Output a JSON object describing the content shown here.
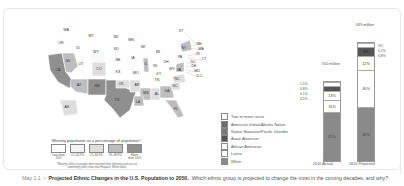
{
  "map": {
    "states": [
      {
        "abbr": "WA",
        "x": 66,
        "y": 30
      },
      {
        "abbr": "OR",
        "x": 61,
        "y": 43
      },
      {
        "abbr": "ID",
        "x": 78,
        "y": 48
      },
      {
        "abbr": "MT",
        "x": 91,
        "y": 36
      },
      {
        "abbr": "WY",
        "x": 96,
        "y": 52
      },
      {
        "abbr": "ND",
        "x": 116,
        "y": 37
      },
      {
        "abbr": "SD",
        "x": 116,
        "y": 49
      },
      {
        "abbr": "MN",
        "x": 131,
        "y": 40
      },
      {
        "abbr": "WI",
        "x": 143,
        "y": 47
      },
      {
        "abbr": "MI",
        "x": 158,
        "y": 52
      },
      {
        "abbr": "NE",
        "x": 118,
        "y": 60
      },
      {
        "abbr": "IA",
        "x": 133,
        "y": 58
      },
      {
        "abbr": "IL",
        "x": 146,
        "y": 64
      },
      {
        "abbr": "IN",
        "x": 155,
        "y": 66
      },
      {
        "abbr": "OH",
        "x": 166,
        "y": 62
      },
      {
        "abbr": "PA",
        "x": 180,
        "y": 57
      },
      {
        "abbr": "NY",
        "x": 184,
        "y": 48
      },
      {
        "abbr": "VT",
        "x": 181,
        "y": 31
      },
      {
        "abbr": "NH",
        "x": 199,
        "y": 44
      },
      {
        "abbr": "MA",
        "x": 201,
        "y": 49
      },
      {
        "abbr": "RI",
        "x": 198,
        "y": 54
      },
      {
        "abbr": "CT",
        "x": 204,
        "y": 59
      },
      {
        "abbr": "NJ",
        "x": 193,
        "y": 62
      },
      {
        "abbr": "DE",
        "x": 194,
        "y": 66
      },
      {
        "abbr": "MD",
        "x": 197,
        "y": 71
      },
      {
        "abbr": "D.C.",
        "x": 200,
        "y": 76
      },
      {
        "abbr": "NV",
        "x": 68,
        "y": 61
      },
      {
        "abbr": "UT",
        "x": 81,
        "y": 64
      },
      {
        "abbr": "CO",
        "x": 99,
        "y": 69
      },
      {
        "abbr": "KS",
        "x": 118,
        "y": 72
      },
      {
        "abbr": "MO",
        "x": 136,
        "y": 73
      },
      {
        "abbr": "KY",
        "x": 159,
        "y": 74
      },
      {
        "abbr": "WV",
        "x": 172,
        "y": 69
      },
      {
        "abbr": "VA",
        "x": 179,
        "y": 70
      },
      {
        "abbr": "CA",
        "x": 58,
        "y": 70
      },
      {
        "abbr": "AZ",
        "x": 79,
        "y": 85
      },
      {
        "abbr": "NM",
        "x": 97,
        "y": 86
      },
      {
        "abbr": "OK",
        "x": 121,
        "y": 84
      },
      {
        "abbr": "AR",
        "x": 137,
        "y": 85
      },
      {
        "abbr": "TN",
        "x": 157,
        "y": 80
      },
      {
        "abbr": "NC",
        "x": 177,
        "y": 79
      },
      {
        "abbr": "SC",
        "x": 175,
        "y": 86
      },
      {
        "abbr": "MS",
        "x": 146,
        "y": 93
      },
      {
        "abbr": "AL",
        "x": 157,
        "y": 94
      },
      {
        "abbr": "GA",
        "x": 167,
        "y": 91
      },
      {
        "abbr": "TX",
        "x": 117,
        "y": 100
      },
      {
        "abbr": "LA",
        "x": 138,
        "y": 102
      },
      {
        "abbr": "FL",
        "x": 176,
        "y": 109
      },
      {
        "abbr": "AK",
        "x": 67,
        "y": 107
      }
    ],
    "legend": {
      "title": "Minority population as a percentage of population*",
      "bins": [
        {
          "label": "Less than 15%",
          "color": "#ffffff"
        },
        {
          "label": "15-24.9%",
          "color": "#f3f3f3"
        },
        {
          "label": "25-34.9%",
          "color": "#dedede"
        },
        {
          "label": "35-49.9%",
          "color": "#bdbdbd"
        },
        {
          "label": "More than 50%",
          "color": "#8f8f8f"
        }
      ],
      "note": "*Minority refers to people who reported their ethnicity and race as something other than non-Hispanic White alone"
    }
  },
  "chart_data": {
    "type": "bar",
    "stacked": true,
    "title": "",
    "categories": [
      "2010 Actual",
      "2050 Projected"
    ],
    "totals": [
      "310 million",
      "439 million"
    ],
    "series": [
      {
        "name": "White",
        "values": [
          65,
          46
        ],
        "color": "#8a8a8a"
      },
      {
        "name": "Latino",
        "values": [
          16,
          30
        ],
        "color": "#ffffff"
      },
      {
        "name": "African American",
        "values": [
          13,
          12
        ],
        "color": "#ffffff"
      },
      {
        "name": "Asian American",
        "values": [
          4.5,
          8
        ],
        "color": "#555555"
      },
      {
        "name": "Native Hawaiian/Pacific Islander",
        "values": [
          0.1,
          0.8
        ],
        "color": "#6e6e6e"
      },
      {
        "name": "American Indian/Alaska Native",
        "values": [
          0.8,
          0.2
        ],
        "color": "#6e6e6e"
      },
      {
        "name": "Two or more races",
        "values": [
          1.5,
          3
        ],
        "color": "#ffffff"
      }
    ],
    "small_labels": {
      "2010": [
        "1.5%",
        "0.8%",
        "0.1%",
        "4.5%"
      ],
      "2050": [
        "3%",
        "0.2%",
        "0.8%"
      ]
    },
    "segment_labels": {
      "2010": [
        "65%",
        "16%",
        "13%"
      ],
      "2050": [
        "46%",
        "30%",
        "12%",
        "8%"
      ]
    },
    "legend": [
      "Two or more races",
      "American Indian/Alaska Native",
      "Native Hawaiian/Pacific Islander",
      "Asian American",
      "African American",
      "Latino",
      "White"
    ]
  },
  "caption": {
    "map_label": "Map 1.1",
    "separator": "•",
    "title": "Projected Ethnic Changes in the U.S. Population to 2050.",
    "question": "Which ethnic group is projected to change the most in the coming decades, and why?"
  }
}
